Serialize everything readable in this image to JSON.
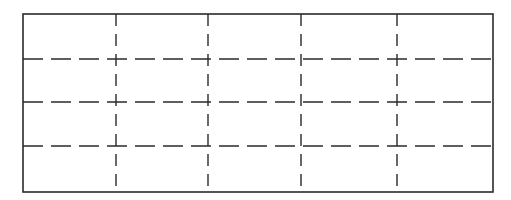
{
  "diagram": {
    "type": "grid",
    "columns": 5,
    "rows": 4,
    "outer_border": {
      "x1": 23,
      "y1": 14,
      "x2": 493,
      "y2": 192,
      "style": "solid",
      "color": "#2a2a2a",
      "width": 1.6
    },
    "vertical_lines": {
      "x": [
        116,
        208,
        301,
        397
      ],
      "style": "dashed",
      "dash": "12 8",
      "color": "#2a2a2a",
      "width": 1.4
    },
    "horizontal_lines": {
      "y": [
        59,
        102,
        146
      ],
      "style": "dashed",
      "dash": "20 8",
      "color": "#2a2a2a",
      "width": 1.4
    },
    "background": "#ffffff"
  }
}
